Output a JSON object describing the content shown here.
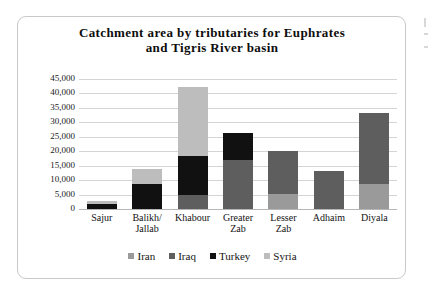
{
  "chart_data": {
    "type": "bar",
    "stacked": true,
    "title": "Catchment area by tributaries for Euphrates and Tigris River basin",
    "title_lines": [
      "Catchment  area  by  tributaries  for  Euphrates",
      "and  Tigris  River  basin"
    ],
    "xlabel": "",
    "ylabel": "",
    "ylim": [
      0,
      45000
    ],
    "ytick_step": 5000,
    "ytick_labels": [
      "45,000",
      "40,000",
      "35,000",
      "30,000",
      "25,000",
      "20,000",
      "15,000",
      "10,000",
      "5,000",
      "0"
    ],
    "ytick_values": [
      45000,
      40000,
      35000,
      30000,
      25000,
      20000,
      15000,
      10000,
      5000,
      0
    ],
    "grid": true,
    "legend_position": "bottom",
    "categories": [
      "Sajur",
      "Balikh/ Jallab",
      "Khabour",
      "Greater Zab",
      "Lesser Zab",
      "Adhaim",
      "Diyala"
    ],
    "category_lines": [
      [
        "Sajur",
        ""
      ],
      [
        "Balikh/",
        "Jallab"
      ],
      [
        "Khabour",
        ""
      ],
      [
        "Greater",
        "Zab"
      ],
      [
        "Lesser",
        "Zab"
      ],
      [
        "Adhaim",
        ""
      ],
      [
        "Diyala",
        ""
      ]
    ],
    "series": [
      {
        "name": "Iran",
        "color": "#9a9a9a",
        "values": [
          0,
          0,
          0,
          0,
          5300,
          0,
          8700
        ]
      },
      {
        "name": "Iraq",
        "color": "#5e5e5e",
        "values": [
          0,
          0,
          5000,
          17000,
          14700,
          13200,
          24500
        ]
      },
      {
        "name": "Turkey",
        "color": "#111111",
        "values": [
          1900,
          8500,
          13500,
          9200,
          0,
          0,
          0
        ]
      },
      {
        "name": "Syria",
        "color": "#bdbdbd",
        "values": [
          900,
          5300,
          23800,
          0,
          0,
          0,
          0
        ]
      }
    ],
    "totals": [
      2800,
      13800,
      42300,
      26200,
      20000,
      13200,
      33200
    ]
  },
  "colors": {
    "iran": "#9a9a9a",
    "iraq": "#5e5e5e",
    "turkey": "#111111",
    "syria": "#bdbdbd",
    "gridline": "#d4d4d4",
    "card_border": "#c9c9c9",
    "text": "#121212"
  }
}
